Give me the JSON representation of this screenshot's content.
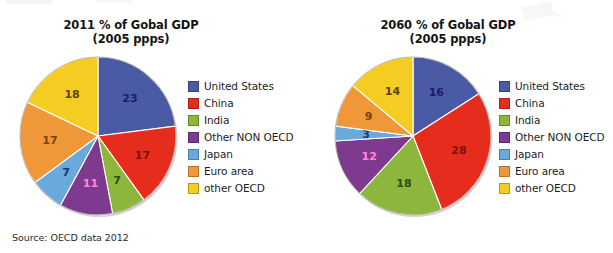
{
  "source_note": "Source: OECD data 2012",
  "legend_labels": [
    "United States",
    "China",
    "India",
    "Other NON OECD",
    "Japan",
    "Euro area",
    "other OECD"
  ],
  "palette": {
    "united_states": "#4a5aa5",
    "china": "#e62d1d",
    "india": "#8cb63c",
    "other_non_oecd": "#7d3a8e",
    "japan": "#6aa9dd",
    "euro_area": "#f0973a",
    "other_oecd": "#f5cc22"
  },
  "label_colors": {
    "united_states": "#1b1b6e",
    "china": "#7e1109",
    "india": "#2f4a10",
    "other_non_oecd": "#ff8ad8",
    "japan": "#173a68",
    "euro_area": "#7a4407",
    "other_oecd": "#5a4705"
  },
  "charts": [
    {
      "id": "chart-2011",
      "title": "2011 % of Gobal GDP",
      "subtitle": "(2005 ppps)",
      "values": [
        23,
        17,
        7,
        11,
        7,
        17,
        18
      ]
    },
    {
      "id": "chart-2060",
      "title": "2060 % of Gobal GDP",
      "subtitle": "(2005 ppps)",
      "values": [
        16,
        28,
        18,
        12,
        3,
        9,
        14
      ]
    }
  ],
  "chart_data": [
    {
      "type": "pie",
      "title": "2011 % of Gobal GDP (2005 ppps)",
      "subtitle": "(2005 ppps)",
      "categories": [
        "United States",
        "China",
        "India",
        "Other NON OECD",
        "Japan",
        "Euro area",
        "other OECD"
      ],
      "values": [
        23,
        17,
        7,
        11,
        7,
        17,
        18
      ],
      "unit": "% of global GDP",
      "colors": [
        "#4a5aa5",
        "#e62d1d",
        "#8cb63c",
        "#7d3a8e",
        "#6aa9dd",
        "#f0973a",
        "#f5cc22"
      ],
      "start_angle_deg": 0,
      "direction": "clockwise",
      "legend_position": "right",
      "data_labels": true,
      "grid": false,
      "source": "Source: OECD data 2012"
    },
    {
      "type": "pie",
      "title": "2060 % of Gobal GDP (2005 ppps)",
      "subtitle": "(2005 ppps)",
      "categories": [
        "United States",
        "China",
        "India",
        "Other NON OECD",
        "Japan",
        "Euro area",
        "other OECD"
      ],
      "values": [
        16,
        28,
        18,
        12,
        3,
        9,
        14
      ],
      "unit": "% of global GDP",
      "colors": [
        "#4a5aa5",
        "#e62d1d",
        "#8cb63c",
        "#7d3a8e",
        "#6aa9dd",
        "#f0973a",
        "#f5cc22"
      ],
      "start_angle_deg": 0,
      "direction": "clockwise",
      "legend_position": "right",
      "data_labels": true,
      "grid": false,
      "source": "Source: OECD data 2012"
    }
  ]
}
